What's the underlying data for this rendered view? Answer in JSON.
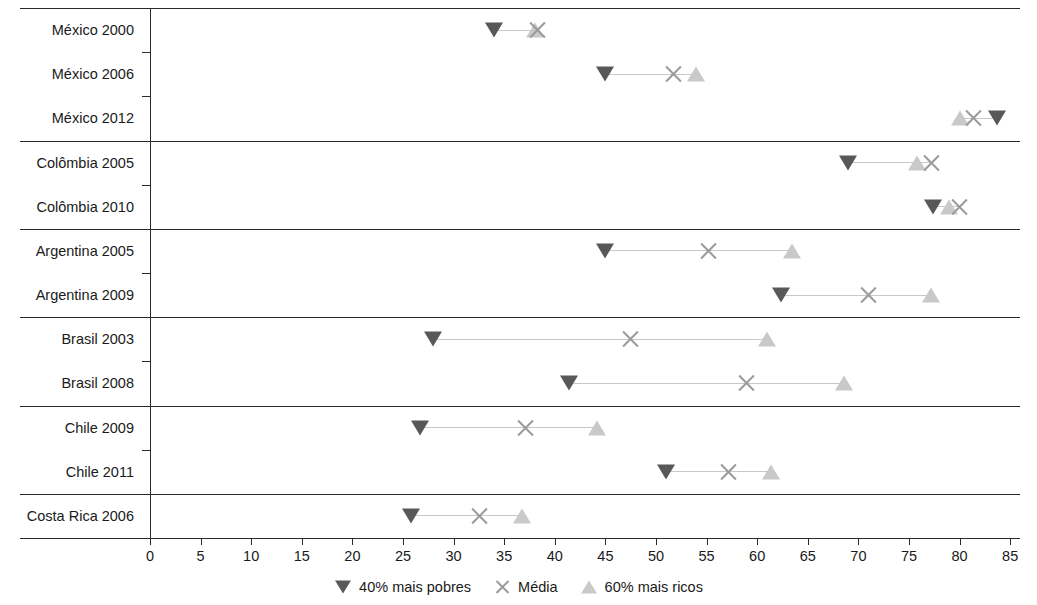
{
  "chart_data": {
    "type": "scatter",
    "title": "",
    "subtitle": "",
    "xlabel": "",
    "ylabel": "",
    "xlim": [
      0,
      85
    ],
    "xticks": [
      0,
      5,
      10,
      15,
      20,
      25,
      30,
      35,
      40,
      45,
      50,
      55,
      60,
      65,
      70,
      75,
      80,
      85
    ],
    "xtick_labels": [
      "0",
      "5",
      "10",
      "15",
      "20",
      "25",
      "30",
      "35",
      "40",
      "45",
      "50",
      "55",
      "60",
      "65",
      "70",
      "75",
      "80",
      "85"
    ],
    "grid": false,
    "legend_position": "bottom",
    "orientation": "horizontal",
    "series": [
      {
        "name": "40% mais pobres",
        "marker": "triangle-down",
        "color": "#58585a",
        "values": [
          34.0,
          45.0,
          83.7,
          69.0,
          77.4,
          45.0,
          62.4,
          28.0,
          41.4,
          26.7,
          51.0,
          25.8
        ]
      },
      {
        "name": "Média",
        "marker": "cross",
        "color": "#9a9a9a",
        "values": [
          38.3,
          51.7,
          81.4,
          77.2,
          80.0,
          55.2,
          71.0,
          47.5,
          58.9,
          37.1,
          57.2,
          32.6
        ]
      },
      {
        "name": "60% mais ricos",
        "marker": "triangle-up",
        "color": "#c9c9c9",
        "values": [
          38.0,
          54.0,
          80.0,
          75.8,
          79.0,
          63.4,
          77.2,
          61.0,
          68.6,
          44.2,
          61.4,
          36.8
        ]
      }
    ],
    "categories": [
      "México 2000",
      "México 2006",
      "México 2012",
      "Colômbia 2005",
      "Colômbia 2010",
      "Argentina 2005",
      "Argentina 2009",
      "Brasil 2003",
      "Brasil 2008",
      "Chile 2009",
      "Chile 2011",
      "Costa Rica 2006"
    ],
    "groups": [
      {
        "country": "México",
        "rows": [
          "México 2000",
          "México 2006",
          "México 2012"
        ]
      },
      {
        "country": "Colômbia",
        "rows": [
          "Colômbia 2005",
          "Colômbia 2010"
        ]
      },
      {
        "country": "Argentina",
        "rows": [
          "Argentina 2005",
          "Argentina 2009"
        ]
      },
      {
        "country": "Brasil",
        "rows": [
          "Brasil 2003",
          "Brasil 2008"
        ]
      },
      {
        "country": "Chile",
        "rows": [
          "Chile 2009",
          "Chile 2011"
        ]
      },
      {
        "country": "Costa Rica",
        "rows": [
          "Costa Rica 2006"
        ]
      }
    ],
    "rows": [
      {
        "label": "México 2000",
        "poorest40": 34.0,
        "media": 38.3,
        "richest60": 38.0,
        "group": 0
      },
      {
        "label": "México 2006",
        "poorest40": 45.0,
        "media": 51.7,
        "richest60": 54.0,
        "group": 0
      },
      {
        "label": "México 2012",
        "poorest40": 83.7,
        "media": 81.4,
        "richest60": 80.0,
        "group": 0
      },
      {
        "label": "Colômbia 2005",
        "poorest40": 69.0,
        "media": 77.2,
        "richest60": 75.8,
        "group": 1
      },
      {
        "label": "Colômbia 2010",
        "poorest40": 77.4,
        "media": 80.0,
        "richest60": 79.0,
        "group": 1
      },
      {
        "label": "Argentina 2005",
        "poorest40": 45.0,
        "media": 55.2,
        "richest60": 63.4,
        "group": 2
      },
      {
        "label": "Argentina 2009",
        "poorest40": 62.4,
        "media": 71.0,
        "richest60": 77.2,
        "group": 2
      },
      {
        "label": "Brasil 2003",
        "poorest40": 28.0,
        "media": 47.5,
        "richest60": 61.0,
        "group": 3
      },
      {
        "label": "Brasil 2008",
        "poorest40": 41.4,
        "media": 58.9,
        "richest60": 68.6,
        "group": 3
      },
      {
        "label": "Chile 2009",
        "poorest40": 26.7,
        "media": 37.1,
        "richest60": 44.2,
        "group": 4
      },
      {
        "label": "Chile 2011",
        "poorest40": 51.0,
        "media": 57.2,
        "richest60": 61.4,
        "group": 4
      },
      {
        "label": "Costa Rica 2006",
        "poorest40": 25.8,
        "media": 32.6,
        "richest60": 36.8,
        "group": 5
      }
    ],
    "legend": [
      {
        "label": "40% mais pobres",
        "marker": "triangle-down"
      },
      {
        "label": "Média",
        "marker": "cross"
      },
      {
        "label": "60% mais ricos",
        "marker": "triangle-up"
      }
    ]
  },
  "colors": {
    "poorest40": "#58585a",
    "media": "#9a9a9a",
    "richest60": "#c9c9c9",
    "connector": "#c8c8c8",
    "axis": "#2a2a2a",
    "text": "#1a1a1a",
    "background": "#ffffff"
  }
}
